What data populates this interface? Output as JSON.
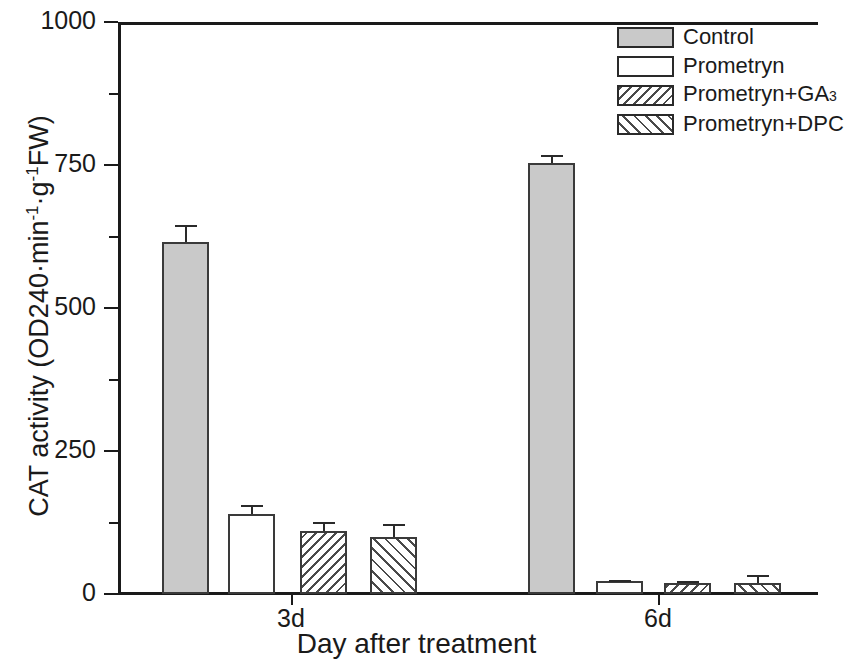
{
  "chart_data": {
    "type": "bar",
    "title": "",
    "xlabel": "Day after treatment",
    "ylabel": "CAT activity (OD240·min⁻¹·g⁻¹FW)",
    "ylabel_parts": {
      "prefix": "CAT activity (OD240·min",
      "sup1": "-1",
      "mid": "·g",
      "sup2": "-1",
      "suffix": "FW)"
    },
    "categories": [
      "3d",
      "6d"
    ],
    "ylim": [
      0,
      1000
    ],
    "yticks": [
      0,
      250,
      500,
      750,
      1000
    ],
    "ytick_labels": [
      "0",
      "250",
      "500",
      "750",
      "1000"
    ],
    "yticks_minor": [
      125,
      375,
      625,
      875
    ],
    "grid": false,
    "legend_position": "top-right",
    "series": [
      {
        "name": "Control",
        "pattern": "solid-gray",
        "values": [
          615,
          753
        ],
        "errors": [
          30,
          15
        ]
      },
      {
        "name": "Prometryn",
        "pattern": "white",
        "values": [
          139,
          22
        ],
        "errors": [
          16,
          3
        ]
      },
      {
        "name": "Prometryn+GA3",
        "pattern": "hatch-back",
        "values": [
          110,
          20
        ],
        "errors": [
          16,
          3
        ]
      },
      {
        "name": "Prometryn+DPC",
        "pattern": "hatch-fwd",
        "values": [
          100,
          20
        ],
        "errors": [
          22,
          14
        ]
      }
    ]
  },
  "legend": {
    "items": [
      {
        "label": "Control",
        "sub": "",
        "pattern": "solid-gray"
      },
      {
        "label": "Prometryn",
        "sub": "",
        "pattern": "white"
      },
      {
        "label": "Prometryn+GA",
        "sub": "3",
        "pattern": "hatch-back"
      },
      {
        "label": "Prometryn+DPC",
        "sub": "",
        "pattern": "hatch-fwd"
      }
    ]
  },
  "colors": {
    "axis": "#1a1a1a",
    "bar_outline": "#3a3a3a",
    "control_fill": "#c9c9c9",
    "hatch_line": "#4a4a4a",
    "background": "#ffffff"
  },
  "geometry": {
    "plot_left": 118,
    "plot_top": 22,
    "plot_width": 700,
    "plot_height": 572,
    "baseline_y": 594,
    "group_bar_x": [
      [
        162,
        228,
        300,
        370
      ],
      [
        528,
        596,
        664,
        734
      ]
    ],
    "bar_width": 47,
    "group_tick_x": [
      291,
      658
    ],
    "group_label_x": [
      291,
      658
    ]
  }
}
